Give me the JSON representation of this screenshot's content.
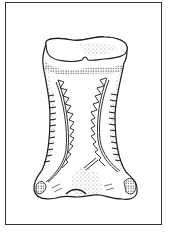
{
  "figure": {
    "frame": {
      "x": 5,
      "y": 2,
      "width": 157,
      "height": 223,
      "stroke": "#333333"
    },
    "ink_color": "#1a1a1a",
    "paper_color": "#ffffff",
    "outline_path": "M46,44 C44,38 58,37 72,40 C84,42 92,36 104,37 C118,37 129,42 127,50 C127,56 126,60 124,63 C121,80 116,95 115,115 C115,140 118,160 126,172 C132,178 138,182 137,192 C136,199 128,200 122,199 C112,199 106,196 100,195 C92,194 86,197 78,197 C70,197 64,195 56,198 C46,200 36,199 34,190 C33,182 38,176 42,170 C48,158 50,140 50,115 C50,95 45,80 43,64 C42,57 44,50 46,44 Z",
    "top_surface_path": "M46,44 C44,38 58,37 72,40 C84,42 92,36 104,37 C118,37 129,42 127,50 C126,56 118,58 104,59 C96,60 92,61 88,60 C86,56 84,56 82,60 C76,62 68,62 58,60 C50,58 46,54 46,44 Z",
    "left_zigzag": {
      "curve": "M58,80 C66,100 70,130 68,150 C66,164 56,176 48,182",
      "teeth": [
        [
          58,
          82
        ],
        [
          64,
          92
        ],
        [
          66,
          104
        ],
        [
          69,
          116
        ],
        [
          70,
          128
        ],
        [
          70,
          140
        ],
        [
          68,
          152
        ],
        [
          64,
          164
        ]
      ]
    },
    "right_zigzag": {
      "curve": "M107,78 C100,96 96,120 98,140 C100,155 110,166 118,172",
      "teeth": [
        [
          106,
          80
        ],
        [
          100,
          92
        ],
        [
          97,
          104
        ],
        [
          95,
          116
        ],
        [
          95,
          128
        ],
        [
          96,
          140
        ],
        [
          100,
          152
        ],
        [
          106,
          162
        ]
      ]
    },
    "annotations": []
  }
}
